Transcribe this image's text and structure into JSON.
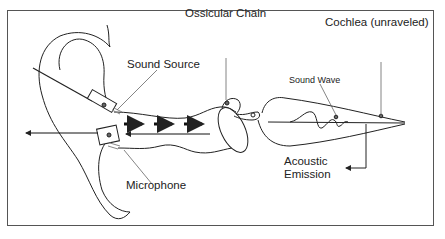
{
  "diagram": {
    "type": "anatomical schematic of otoacoustic emission measurement",
    "labels": {
      "ossicular_chain": "Ossicular Chain",
      "cochlea": "Cochlea (unraveled)",
      "sound_source": "Sound Source",
      "sound_wave": "Sound Wave",
      "microphone": "Microphone",
      "acoustic_emission_line1": "Acoustic",
      "acoustic_emission_line2": "Emission"
    },
    "colors": {
      "stroke": "#222222",
      "leader": "#666666",
      "frame": "#555555",
      "background": "#ffffff"
    }
  }
}
